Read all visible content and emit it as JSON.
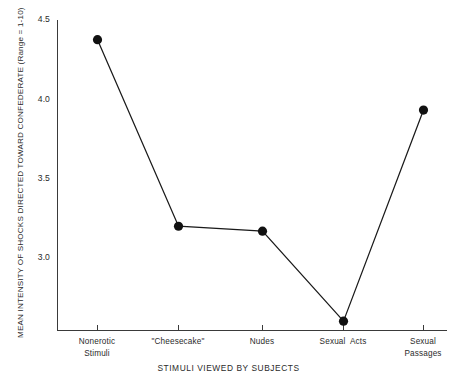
{
  "chart_data": {
    "type": "line",
    "title": "",
    "xlabel": "STIMULI VIEWED BY SUBJECTS",
    "ylabel": "MEAN INTENSITY OF SHOCKS DIRECTED TOWARD CONFEDERATE (Range = 1-10)",
    "categories": [
      "Nonerotic\nStimuli",
      "\"Cheesecake\"",
      "Nudes",
      "Sexual  Acts",
      "Sexual\nPassages"
    ],
    "values": [
      4.5,
      3.36,
      3.33,
      2.78,
      4.07
    ],
    "ylim": [
      2.72,
      4.62
    ],
    "yticks": [
      3.0,
      3.5,
      4.0,
      4.5
    ],
    "ytick_labels": [
      "3.0",
      "3.5",
      "4.0",
      "4.5"
    ],
    "grid": false,
    "legend": "none",
    "marker": "filled-circle",
    "line_color": "#1a1a1a",
    "marker_color": "#111111",
    "axis_color": "#3a3a3a",
    "background": "#ffffff"
  }
}
